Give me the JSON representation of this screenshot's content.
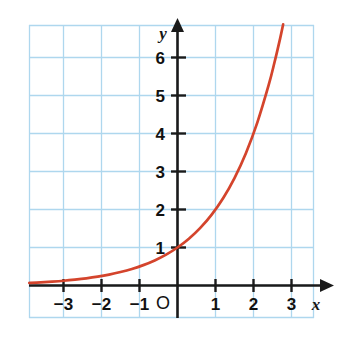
{
  "figure": {
    "name": "exponential-function-graph",
    "background_color": "#ffffff"
  },
  "chart_data": {
    "type": "line",
    "title": "",
    "subtitle": "",
    "xlabel": "x",
    "ylabel": "y",
    "function": "y = 2^x",
    "xlim": [
      -3.9,
      3.55
    ],
    "ylim": [
      -0.85,
      6.85
    ],
    "grid": true,
    "grid_color": "#aed7ee",
    "grid_spacing": 1,
    "legend": "none",
    "axis_color": "#1a1a1a",
    "curve_color": "#d4442c",
    "x_ticks": [
      -3,
      -2,
      -1,
      1,
      2,
      3
    ],
    "x_tick_labels": [
      "−3",
      "−2",
      "−1",
      "1",
      "2",
      "3"
    ],
    "y_ticks": [
      1,
      2,
      3,
      4,
      5,
      6
    ],
    "y_tick_labels": [
      "1",
      "2",
      "3",
      "4",
      "5",
      "6"
    ],
    "origin_label": "O",
    "x_axis_arrow": true,
    "y_axis_arrow": true,
    "series": [
      {
        "name": "y = 2^x",
        "color": "#d4442c",
        "x": [
          -3.9,
          -3.6,
          -3.3,
          -3.0,
          -2.7,
          -2.4,
          -2.1,
          -1.8,
          -1.5,
          -1.2,
          -0.9,
          -0.6,
          -0.3,
          0.0,
          0.3,
          0.6,
          0.9,
          1.2,
          1.5,
          1.8,
          2.1,
          2.4,
          2.55,
          2.7,
          2.78
        ],
        "y": [
          0.067,
          0.082,
          0.102,
          0.125,
          0.154,
          0.189,
          0.233,
          0.287,
          0.354,
          0.435,
          0.536,
          0.66,
          0.812,
          1.0,
          1.231,
          1.516,
          1.866,
          2.297,
          2.828,
          3.482,
          4.287,
          5.278,
          5.861,
          6.498,
          6.87
        ]
      }
    ],
    "key_points": [
      {
        "x": 0,
        "y": 1,
        "note": "y-intercept"
      },
      {
        "x": 1,
        "y": 2,
        "note": ""
      },
      {
        "x": 2,
        "y": 4,
        "note": ""
      }
    ]
  }
}
